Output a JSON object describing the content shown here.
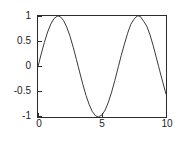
{
  "figure": {
    "background_color": "#ffffff",
    "axes_color": "#2b2b2b",
    "line_color": "#3a3a3a",
    "tick_label_color": "#1c1c1c"
  },
  "chart_data": {
    "type": "line",
    "title": "",
    "subtitle": "",
    "xlabel": "",
    "ylabel": "",
    "xlim": [
      0,
      10
    ],
    "ylim": [
      -1,
      1
    ],
    "grid": false,
    "legend": null,
    "legend_position": "none",
    "x_ticks": [
      0,
      5,
      10
    ],
    "x_tick_labels": [
      "0",
      "5",
      "10"
    ],
    "y_ticks": [
      -1,
      -0.5,
      0,
      0.5,
      1
    ],
    "y_tick_labels": [
      "-1",
      "-0.5",
      "0",
      "0.5",
      "1"
    ],
    "series": [
      {
        "name": "sin(x)",
        "color": "#3a3a3a",
        "linewidth": 1,
        "x": [
          0,
          0.25,
          0.5,
          0.75,
          1,
          1.25,
          1.5,
          1.5708,
          1.75,
          2,
          2.25,
          2.5,
          2.75,
          3,
          3.1416,
          3.25,
          3.5,
          3.75,
          4,
          4.25,
          4.5,
          4.7124,
          5,
          5.25,
          5.5,
          5.75,
          6,
          6.2832,
          6.5,
          6.75,
          7,
          7.25,
          7.5,
          7.75,
          7.854,
          8,
          8.25,
          8.5,
          8.75,
          9,
          9.25,
          9.4248,
          9.5,
          9.75,
          10
        ],
        "y": [
          0,
          0.247,
          0.479,
          0.682,
          0.841,
          0.949,
          0.997,
          1,
          0.984,
          0.909,
          0.778,
          0.599,
          0.382,
          0.141,
          0,
          -0.108,
          -0.351,
          -0.572,
          -0.757,
          -0.895,
          -0.978,
          -1,
          -0.959,
          -0.861,
          -0.706,
          -0.508,
          -0.279,
          0,
          0.215,
          0.442,
          0.657,
          0.835,
          0.938,
          0.999,
          1,
          0.989,
          0.896,
          0.798,
          0.628,
          0.412,
          0.172,
          0,
          -0.075,
          -0.313,
          -0.544
        ]
      }
    ]
  }
}
